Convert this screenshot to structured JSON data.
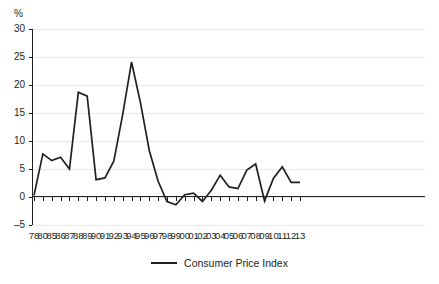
{
  "chart_data": {
    "type": "line",
    "title": "",
    "xlabel": "",
    "ylabel": "%",
    "ylim": [
      -5,
      30
    ],
    "yticks": [
      30,
      25,
      20,
      15,
      10,
      5,
      0,
      -5
    ],
    "grid": true,
    "grid_color": "#e9e9ea",
    "legend_position": "bottom-center",
    "series_color": "#231f20",
    "categories": [
      "78",
      "80",
      "85",
      "86",
      "87",
      "88",
      "89",
      "90",
      "91",
      "92",
      "93",
      "94",
      "95",
      "96",
      "97",
      "98",
      "99",
      "00",
      "01",
      "02",
      "03",
      "04",
      "05",
      "06",
      "07",
      "08",
      "09",
      "10",
      "11",
      "12",
      "13"
    ],
    "series": [
      {
        "name": "Consumer Price Index",
        "values": [
          0.3,
          7.7,
          6.5,
          7.1,
          5.0,
          18.7,
          18.0,
          3.1,
          3.4,
          6.4,
          14.7,
          24.1,
          16.9,
          8.3,
          2.8,
          -0.8,
          -1.4,
          0.4,
          0.7,
          -0.8,
          1.2,
          3.9,
          1.8,
          1.5,
          4.8,
          5.9,
          -0.7,
          3.3,
          5.4,
          2.6,
          2.6
        ]
      }
    ]
  },
  "axis": {
    "unit_label": "%"
  },
  "legend": {
    "entries": [
      {
        "label": "Consumer Price Index"
      }
    ]
  }
}
